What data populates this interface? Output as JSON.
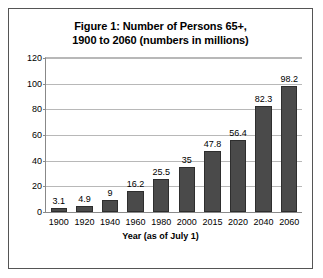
{
  "figure": {
    "title_line1": "Figure 1:  Number of Persons 65+,",
    "title_line2": "1900 to 2060 (numbers in millions)",
    "frame_color": "#555555",
    "background_color": "#ffffff"
  },
  "chart_data": {
    "type": "bar",
    "title": "Figure 1:  Number of Persons 65+, 1900 to 2060 (numbers in millions)",
    "xlabel": "Year (as of July 1)",
    "ylabel": "",
    "categories": [
      "1900",
      "1920",
      "1940",
      "1960",
      "1980",
      "2000",
      "2015",
      "2020",
      "2040",
      "2060"
    ],
    "values": [
      3.1,
      4.9,
      9,
      16.2,
      25.5,
      35,
      47.8,
      56.4,
      82.3,
      98.2
    ],
    "data_labels": [
      "3.1",
      "4.9",
      "9",
      "16.2",
      "25.5",
      "35",
      "47.8",
      "56.4",
      "82.3",
      "98.2"
    ],
    "ylim": [
      0,
      120
    ],
    "yticks": [
      0,
      20,
      40,
      60,
      80,
      100,
      120
    ],
    "ytick_labels": [
      "0",
      "20",
      "40",
      "60",
      "80",
      "100",
      "120"
    ],
    "grid": true,
    "grid_axis": "y",
    "grid_color": "#b8b8b8",
    "legend": false,
    "bar_color": "#4a4a4a",
    "bar_edge_color": "#2e2e2e"
  }
}
